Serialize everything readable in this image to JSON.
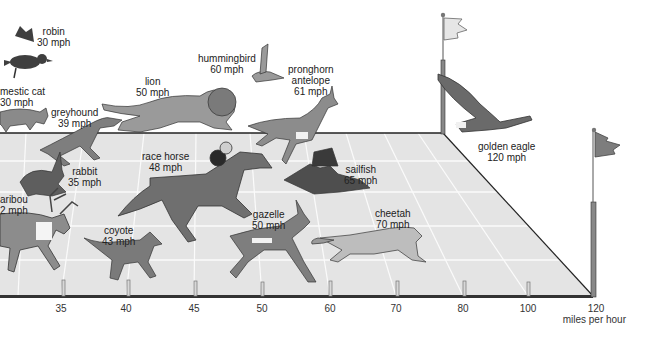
{
  "diagram": {
    "axis": {
      "unit_label": "miles per hour",
      "ticks": [
        {
          "value": "35",
          "x": 61
        },
        {
          "value": "40",
          "x": 126
        },
        {
          "value": "45",
          "x": 194
        },
        {
          "value": "50",
          "x": 262
        },
        {
          "value": "60",
          "x": 330
        },
        {
          "value": "70",
          "x": 396
        },
        {
          "value": "80",
          "x": 463
        },
        {
          "value": "100",
          "x": 528
        },
        {
          "value": "120",
          "x": 596
        }
      ]
    },
    "animals": [
      {
        "name": "robin",
        "speed": "30 mph"
      },
      {
        "name": "domestic cat",
        "display_name": "mestic cat",
        "speed": "30 mph"
      },
      {
        "name": "greyhound",
        "speed": "39 mph"
      },
      {
        "name": "lion",
        "speed": "50 mph"
      },
      {
        "name": "hummingbird",
        "speed": "60 mph"
      },
      {
        "name": "pronghorn antelope",
        "line1": "pronghorn",
        "line2": "antelope",
        "speed": "61 mph"
      },
      {
        "name": "rabbit",
        "speed": "35 mph"
      },
      {
        "name": "race horse",
        "speed": "48 mph"
      },
      {
        "name": "caribou",
        "display_name": "aribou",
        "speed": "32 mph",
        "display_speed": "2 mph"
      },
      {
        "name": "coyote",
        "speed": "43 mph"
      },
      {
        "name": "gazelle",
        "speed": "50 mph"
      },
      {
        "name": "sailfish",
        "speed": "65 mph"
      },
      {
        "name": "cheetah",
        "speed": "70 mph"
      },
      {
        "name": "golden eagle",
        "speed": "120 mph"
      }
    ],
    "colors": {
      "track": "#e4e4e4",
      "track_lines": "#fafafa",
      "edge": "#222222",
      "animal_fill": "#7a7a7a",
      "animal_dark": "#3a3a3a",
      "post": "#d8d8d8",
      "flag_light": "#e6e6e6",
      "flag_dark": "#7d7d7d"
    }
  }
}
